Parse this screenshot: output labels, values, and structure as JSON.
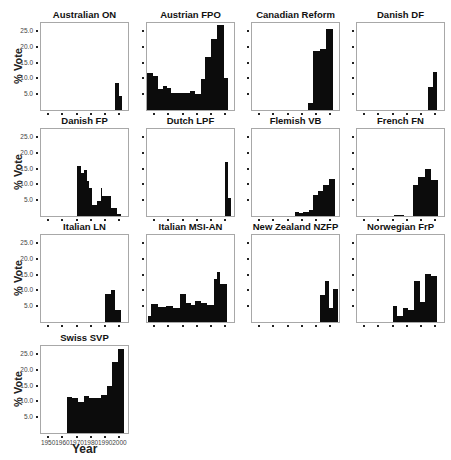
{
  "chart_data": {
    "type": "bar",
    "layout": "small-multiples 4x4 (13 panels)",
    "ylabel": "% Vote",
    "xlabel": "Year",
    "yticks": [
      "5.0",
      "10.0",
      "15.0",
      "20.0",
      "25.0"
    ],
    "xticks": [
      "1950",
      "1960",
      "1970",
      "1980",
      "1990",
      "2000"
    ],
    "ylim": [
      0,
      27.5
    ],
    "xlim": [
      1945,
      2006
    ],
    "panels": [
      {
        "title": "Australian ON",
        "bars": [
          {
            "x0": 1997,
            "x1": 2000,
            "v": 8.4
          },
          {
            "x0": 2000,
            "x1": 2002,
            "v": 4.3
          }
        ]
      },
      {
        "title": "Austrian FPO",
        "bars": [
          {
            "x0": 1945,
            "x1": 1949,
            "v": 11.7
          },
          {
            "x0": 1949,
            "x1": 1953,
            "v": 10.9
          },
          {
            "x0": 1953,
            "x1": 1956,
            "v": 6.5
          },
          {
            "x0": 1956,
            "x1": 1959,
            "v": 7.7
          },
          {
            "x0": 1959,
            "x1": 1962,
            "v": 7.1
          },
          {
            "x0": 1962,
            "x1": 1966,
            "v": 5.4
          },
          {
            "x0": 1966,
            "x1": 1970,
            "v": 5.4
          },
          {
            "x0": 1970,
            "x1": 1975,
            "v": 5.4
          },
          {
            "x0": 1975,
            "x1": 1979,
            "v": 6.1
          },
          {
            "x0": 1979,
            "x1": 1983,
            "v": 5.0
          },
          {
            "x0": 1983,
            "x1": 1986,
            "v": 9.7
          },
          {
            "x0": 1986,
            "x1": 1990,
            "v": 16.6
          },
          {
            "x0": 1990,
            "x1": 1994,
            "v": 22.5
          },
          {
            "x0": 1994,
            "x1": 1999,
            "v": 26.9
          },
          {
            "x0": 1999,
            "x1": 2002,
            "v": 10.0
          }
        ]
      },
      {
        "title": "Canadian Reform",
        "bars": [
          {
            "x0": 1984,
            "x1": 1988,
            "v": 2.1
          },
          {
            "x0": 1988,
            "x1": 1993,
            "v": 18.7
          },
          {
            "x0": 1993,
            "x1": 1997,
            "v": 19.4
          },
          {
            "x0": 1997,
            "x1": 2002,
            "v": 25.5
          }
        ]
      },
      {
        "title": "Danish DF",
        "bars": [
          {
            "x0": 1995,
            "x1": 1998,
            "v": 7.4
          },
          {
            "x0": 1998,
            "x1": 2001,
            "v": 12.0
          }
        ]
      },
      {
        "title": "Danish FP",
        "bars": [
          {
            "x0": 1970,
            "x1": 1973,
            "v": 15.9
          },
          {
            "x0": 1973,
            "x1": 1975,
            "v": 13.6
          },
          {
            "x0": 1975,
            "x1": 1977,
            "v": 14.6
          },
          {
            "x0": 1977,
            "x1": 1979,
            "v": 11.0
          },
          {
            "x0": 1979,
            "x1": 1981,
            "v": 8.9
          },
          {
            "x0": 1981,
            "x1": 1984,
            "v": 3.6
          },
          {
            "x0": 1984,
            "x1": 1987,
            "v": 4.8
          },
          {
            "x0": 1987,
            "x1": 1988,
            "v": 9.0
          },
          {
            "x0": 1988,
            "x1": 1990,
            "v": 6.4
          },
          {
            "x0": 1990,
            "x1": 1994,
            "v": 6.4
          },
          {
            "x0": 1994,
            "x1": 1998,
            "v": 2.4
          },
          {
            "x0": 1998,
            "x1": 2001,
            "v": 0.6
          }
        ]
      },
      {
        "title": "Dutch LPF",
        "bars": [
          {
            "x0": 2000,
            "x1": 2002,
            "v": 17.0
          },
          {
            "x0": 2002,
            "x1": 2004,
            "v": 5.7
          }
        ]
      },
      {
        "title": "Flemish VB",
        "bars": [
          {
            "x0": 1975,
            "x1": 1978,
            "v": 1.4
          },
          {
            "x0": 1978,
            "x1": 1981,
            "v": 1.1
          },
          {
            "x0": 1981,
            "x1": 1985,
            "v": 1.4
          },
          {
            "x0": 1985,
            "x1": 1988,
            "v": 1.9
          },
          {
            "x0": 1988,
            "x1": 1991,
            "v": 6.6
          },
          {
            "x0": 1991,
            "x1": 1995,
            "v": 7.8
          },
          {
            "x0": 1995,
            "x1": 1999,
            "v": 9.9
          },
          {
            "x0": 1999,
            "x1": 2003,
            "v": 11.6
          }
        ]
      },
      {
        "title": "French FN",
        "bars": [
          {
            "x0": 1971,
            "x1": 1978,
            "v": 0.3
          },
          {
            "x0": 1984,
            "x1": 1988,
            "v": 9.7
          },
          {
            "x0": 1988,
            "x1": 1993,
            "v": 12.4
          },
          {
            "x0": 1993,
            "x1": 1997,
            "v": 14.9
          },
          {
            "x0": 1997,
            "x1": 2002,
            "v": 11.3
          }
        ]
      },
      {
        "title": "Italian LN",
        "bars": [
          {
            "x0": 1990,
            "x1": 1994,
            "v": 8.7
          },
          {
            "x0": 1994,
            "x1": 1997,
            "v": 10.1
          },
          {
            "x0": 1997,
            "x1": 2001,
            "v": 3.9
          }
        ]
      },
      {
        "title": "Italian MSI-AN",
        "bars": [
          {
            "x0": 1946,
            "x1": 1948,
            "v": 2.0
          },
          {
            "x0": 1948,
            "x1": 1953,
            "v": 5.8
          },
          {
            "x0": 1953,
            "x1": 1958,
            "v": 4.8
          },
          {
            "x0": 1958,
            "x1": 1963,
            "v": 5.1
          },
          {
            "x0": 1963,
            "x1": 1968,
            "v": 4.5
          },
          {
            "x0": 1968,
            "x1": 1972,
            "v": 8.7
          },
          {
            "x0": 1972,
            "x1": 1976,
            "v": 6.1
          },
          {
            "x0": 1976,
            "x1": 1979,
            "v": 5.3
          },
          {
            "x0": 1979,
            "x1": 1983,
            "v": 6.8
          },
          {
            "x0": 1983,
            "x1": 1987,
            "v": 5.9
          },
          {
            "x0": 1987,
            "x1": 1992,
            "v": 5.4
          },
          {
            "x0": 1992,
            "x1": 1994,
            "v": 13.5
          },
          {
            "x0": 1994,
            "x1": 1996,
            "v": 15.7
          },
          {
            "x0": 1996,
            "x1": 2001,
            "v": 12.0
          }
        ]
      },
      {
        "title": "New Zealand NZFP",
        "bars": [
          {
            "x0": 1993,
            "x1": 1996,
            "v": 8.4
          },
          {
            "x0": 1996,
            "x1": 1999,
            "v": 13.1
          },
          {
            "x0": 1999,
            "x1": 2002,
            "v": 4.3
          },
          {
            "x0": 2002,
            "x1": 2005,
            "v": 10.4
          }
        ]
      },
      {
        "title": "Norwegian FrP",
        "bars": [
          {
            "x0": 1970,
            "x1": 1973,
            "v": 5.0
          },
          {
            "x0": 1973,
            "x1": 1977,
            "v": 1.9
          },
          {
            "x0": 1977,
            "x1": 1981,
            "v": 4.5
          },
          {
            "x0": 1981,
            "x1": 1985,
            "v": 3.7
          },
          {
            "x0": 1985,
            "x1": 1989,
            "v": 13.0
          },
          {
            "x0": 1989,
            "x1": 1993,
            "v": 6.3
          },
          {
            "x0": 1993,
            "x1": 1997,
            "v": 15.3
          },
          {
            "x0": 1997,
            "x1": 2001,
            "v": 14.6
          }
        ]
      },
      {
        "title": "Swiss SVP",
        "bars": [
          {
            "x0": 1963,
            "x1": 1967,
            "v": 11.4
          },
          {
            "x0": 1967,
            "x1": 1971,
            "v": 11.1
          },
          {
            "x0": 1971,
            "x1": 1975,
            "v": 9.9
          },
          {
            "x0": 1975,
            "x1": 1979,
            "v": 11.6
          },
          {
            "x0": 1979,
            "x1": 1983,
            "v": 11.1
          },
          {
            "x0": 1983,
            "x1": 1987,
            "v": 11.1
          },
          {
            "x0": 1987,
            "x1": 1991,
            "v": 11.9
          },
          {
            "x0": 1991,
            "x1": 1995,
            "v": 14.9
          },
          {
            "x0": 1995,
            "x1": 1999,
            "v": 22.5
          },
          {
            "x0": 1999,
            "x1": 2003,
            "v": 26.7
          }
        ]
      }
    ]
  }
}
